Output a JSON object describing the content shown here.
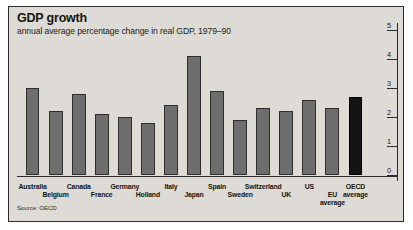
{
  "header": {
    "title": "GDP growth",
    "subtitle": "annual average percentage change in real GDP, 1979–90"
  },
  "source": "Source: OECD",
  "colors": {
    "panel_background": "#dedbd6",
    "bar": "#6e6e6e",
    "bar_highlight": "#141414",
    "axis": "#2b2b2b",
    "text": "#14140f"
  },
  "chart_data": {
    "type": "bar",
    "title": "GDP growth",
    "subtitle": "annual average percentage change in real GDP, 1979–90",
    "xlabel": "",
    "ylabel": "",
    "ylim": [
      0,
      5
    ],
    "yticks": [
      0,
      1,
      2,
      3,
      4,
      5
    ],
    "ytick_labels": [
      "0",
      "1",
      "2",
      "3",
      "4",
      "5"
    ],
    "axis_position": "right",
    "grid": false,
    "legend": "none",
    "source": "Source: OECD",
    "categories": [
      "Australia",
      "Belgium",
      "Canada",
      "France",
      "Germany",
      "Holland",
      "Italy",
      "Japan",
      "Spain",
      "Sweden",
      "Switzerland",
      "UK",
      "US",
      "EU\naverage",
      "OECD\naverage"
    ],
    "values": [
      3.0,
      2.2,
      2.8,
      2.1,
      2.0,
      1.8,
      2.4,
      4.1,
      2.9,
      1.9,
      2.3,
      2.2,
      2.6,
      2.3,
      2.7
    ],
    "highlight_index": 14,
    "label_rows": [
      0,
      1,
      0,
      1,
      0,
      1,
      0,
      1,
      0,
      1,
      0,
      1,
      0,
      1,
      0
    ]
  }
}
